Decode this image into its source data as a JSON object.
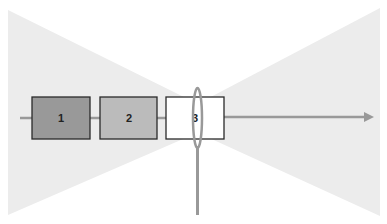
{
  "diagram": {
    "boxes": [
      {
        "label": "1",
        "fill": "#999999"
      },
      {
        "label": "2",
        "fill": "#bbbbbb"
      },
      {
        "label": "3",
        "fill": "#ffffff"
      }
    ],
    "colors": {
      "cone": "#ececec",
      "line": "#999999",
      "stroke": "#2a2a2a"
    }
  }
}
